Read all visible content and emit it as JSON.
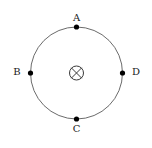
{
  "figure": {
    "background_color": "#ffffff",
    "width": 152,
    "height": 148,
    "circle": {
      "center_x": 76.5,
      "center_y": 73,
      "radius": 46,
      "stroke_color": "#5a5a5a",
      "stroke_width": 0.9
    },
    "center_symbol": {
      "name": "field-into-page",
      "glyph": "⊗",
      "radius": 7,
      "stroke_color": "#3a3a3a",
      "stroke_width": 1
    },
    "points": [
      {
        "id": "A",
        "label": "A",
        "position": "top",
        "dot_x": 76.5,
        "dot_y": 27,
        "dot_radius": 2.6,
        "dot_color": "#000000",
        "label_x": 76.5,
        "label_y": 18
      },
      {
        "id": "B",
        "label": "B",
        "position": "left",
        "dot_x": 30.5,
        "dot_y": 73,
        "dot_radius": 2.6,
        "dot_color": "#000000",
        "label_x": 17,
        "label_y": 72.5
      },
      {
        "id": "C",
        "label": "C",
        "position": "bottom",
        "dot_x": 76.5,
        "dot_y": 119,
        "dot_radius": 2.6,
        "dot_color": "#000000",
        "label_x": 76.5,
        "label_y": 129
      },
      {
        "id": "D",
        "label": "D",
        "position": "right",
        "dot_x": 122.5,
        "dot_y": 73,
        "dot_radius": 2.6,
        "dot_color": "#000000",
        "label_x": 136,
        "label_y": 72.5
      }
    ]
  }
}
